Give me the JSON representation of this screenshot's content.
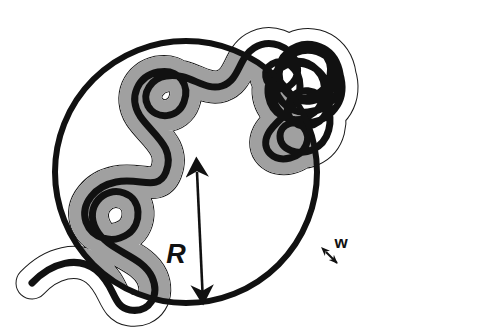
{
  "figure": {
    "domain": "diagram",
    "kind": "polymer-chain-in-confining-sphere",
    "background_color": "#ffffff",
    "ink_color": "#111111",
    "tube_fill_inside": "#a0a0a0",
    "tube_fill_outside": "#ffffff",
    "tube_outline_color": "#1a1a1a",
    "chain_color": "#111111"
  },
  "labels": {
    "radius": {
      "text": "R",
      "meaning": "blob radius",
      "x": 176,
      "y": 263
    },
    "width": {
      "text": "w",
      "meaning": "tube width",
      "x": 341,
      "y": 250
    }
  },
  "annotations": {
    "radius_arrow": {
      "name": "radius-double-arrow",
      "from_x": 197,
      "from_y": 172,
      "to_x": 203,
      "to_y": 303,
      "double_headed": true
    },
    "width_arrow": {
      "name": "width-double-arrow",
      "from_x": 326,
      "from_y": 252,
      "to_x": 337,
      "to_y": 263,
      "double_headed": true
    }
  },
  "confining_circle": {
    "name": "confining-blob-circle",
    "cx": 186,
    "cy": 172,
    "r": 131,
    "stroke_width": 6,
    "fill": "none"
  },
  "chain": {
    "name": "polymer-chain",
    "centerline_stroke_width": 7,
    "tube_stroke_width": 31,
    "path": "M 32 283 C 52 262 78 256 96 270 C 116 286 112 307 130 310 C 150 313 160 295 152 277 C 142 255 108 252 96 229 C 84 207 104 186 124 193 C 142 199 142 224 128 234 C 112 245 92 238 86 222 C 80 203 96 186 116 182 C 140 177 158 192 166 172 C 176 147 152 134 140 116 C 128 97 138 76 158 72 C 180 68 190 86 184 102 C 178 119 156 120 148 106 C 141 93 152 78 166 76 C 190 72 204 92 222 86 C 240 80 238 58 254 48 C 270 38 290 46 296 62 C 302 79 288 92 276 88 C 264 84 262 70 272 64 C 286 56 300 70 300 86 C 300 110 276 118 268 134 C 260 150 274 162 290 158 C 306 154 312 138 304 128 C 296 118 280 124 280 136 C 280 150 298 156 312 150 C 330 142 334 120 326 104 C 318 88 298 86 290 100 C 282 114 294 128 308 126 C 326 123 334 104 328 86 C 320 62 292 56 276 72 C 262 86 268 108 282 116 C 300 126 320 114 324 96 C 328 74 310 58 292 62 C 272 67 266 90 276 106 C 288 126 316 128 332 112 C 348 96 344 68 326 56 C 306 43 282 54 276 74 C 270 96 288 114 308 112 C 332 110 346 88 338 66 C 330 44 304 38 288 52 C 274 64 276 86 290 94 C 306 104 326 94 330 76 C 334 56 316 42 298 48 C 278 55 274 78 286 92 C 300 108 326 102 334 84 C 342 66 328 46 308 46 C 286 46 274 66 280 84",
    "tube_outside_segments_note": "Chain tails at lower-left and lower-right extend beyond the confining circle."
  }
}
